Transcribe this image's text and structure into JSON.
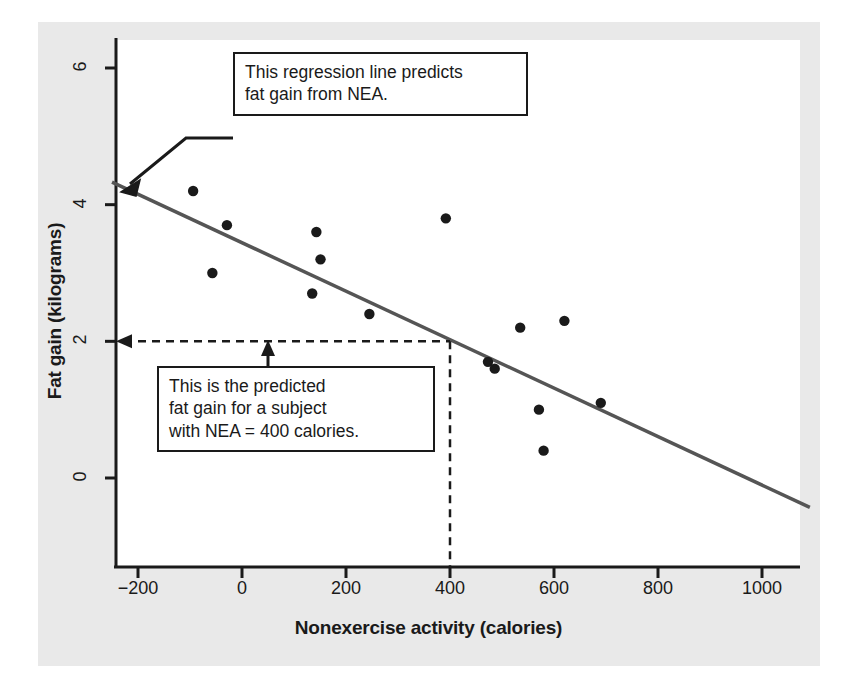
{
  "chart_data": {
    "type": "scatter",
    "title": "",
    "xlabel": "Nonexercise activity (calories)",
    "ylabel": "Fat gain (kilograms)",
    "xlim": [
      -280,
      1100
    ],
    "ylim": [
      -0.9,
      6.6
    ],
    "xticks": [
      "−200",
      "0",
      "200",
      "400",
      "600",
      "800",
      "1000"
    ],
    "xtick_values": [
      -200,
      0,
      200,
      400,
      600,
      800,
      1000
    ],
    "yticks": [
      "0",
      "2",
      "4",
      "6"
    ],
    "ytick_values": [
      0,
      2,
      4,
      6
    ],
    "grid": false,
    "legend": "none",
    "points": [
      {
        "x": -94,
        "y": 4.2
      },
      {
        "x": -57,
        "y": 3.0
      },
      {
        "x": -29,
        "y": 3.7
      },
      {
        "x": 135,
        "y": 2.7
      },
      {
        "x": 143,
        "y": 3.6
      },
      {
        "x": 151,
        "y": 3.2
      },
      {
        "x": 245,
        "y": 2.4
      },
      {
        "x": 355,
        "y": 1.3
      },
      {
        "x": 392,
        "y": 3.8
      },
      {
        "x": 473,
        "y": 1.7
      },
      {
        "x": 486,
        "y": 1.6
      },
      {
        "x": 535,
        "y": 2.2
      },
      {
        "x": 571,
        "y": 1.0
      },
      {
        "x": 580,
        "y": 0.4
      },
      {
        "x": 620,
        "y": 2.3
      },
      {
        "x": 690,
        "y": 1.1
      }
    ],
    "regression_line": {
      "name": "regression line",
      "x_start": -250,
      "y_start": 4.33,
      "x_end": 1092,
      "y_end": -0.43,
      "color": "#555555"
    },
    "prediction": {
      "nea": 400,
      "fat_gain": 2.0,
      "guide_color": "#1a1a1a",
      "style": "dashed"
    },
    "annotations": [
      {
        "name": "regression-callout",
        "text": "This regression line predicts\nfat gain from NEA.",
        "points_to_x": -213,
        "points_to_y": 4.15
      },
      {
        "name": "prediction-callout",
        "text": "This is the predicted\nfat gain for a subject\nwith NEA = 400 calories.",
        "points_to_x": 32,
        "points_to_y": 2.0
      }
    ],
    "colors": {
      "point": "#1a1a1a",
      "axis": "#1a1a1a",
      "regression": "#555555",
      "figure_background": "#e9e9e9",
      "plot_background": "#ffffff",
      "page_background": "#ffffff"
    }
  }
}
